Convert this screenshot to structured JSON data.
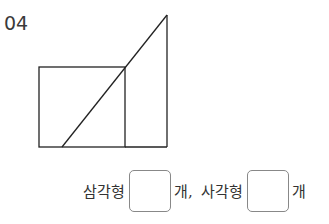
{
  "problem": {
    "number": "04",
    "answer_row": {
      "label1": "삼각형",
      "unit1": "개,",
      "label2": "사각형",
      "unit2": "개",
      "box1_value": "",
      "box2_value": ""
    }
  }
}
